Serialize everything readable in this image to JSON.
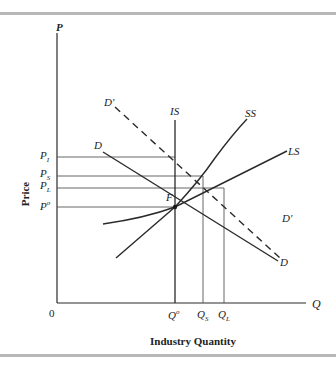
{
  "diagram": {
    "type": "supply-demand",
    "axes": {
      "y_symbol": "P",
      "x_symbol": "Q",
      "origin": "0",
      "y_title": "Price",
      "x_title": "Industry Quantity"
    },
    "price_levels": [
      {
        "id": "P_I",
        "base": "P",
        "sub": "I"
      },
      {
        "id": "P_S",
        "base": "P",
        "sub": "S"
      },
      {
        "id": "P_L",
        "base": "P",
        "sub": "L"
      },
      {
        "id": "P_o",
        "base": "P",
        "sup": "o"
      }
    ],
    "quantity_levels": [
      {
        "id": "Q_o",
        "base": "Q",
        "sup": "o"
      },
      {
        "id": "Q_S",
        "base": "Q",
        "sub": "S"
      },
      {
        "id": "Q_L",
        "base": "Q",
        "sub": "L"
      }
    ],
    "curves": [
      {
        "id": "D",
        "label": "D",
        "style": "solid",
        "kind": "demand"
      },
      {
        "id": "D_prime",
        "label": "D′",
        "style": "dashed",
        "kind": "shifted demand"
      },
      {
        "id": "IS",
        "label": "IS",
        "style": "solid",
        "kind": "immediate supply (vertical)"
      },
      {
        "id": "SS",
        "label": "SS",
        "style": "solid",
        "kind": "short-run supply"
      },
      {
        "id": "LS",
        "label": "LS",
        "style": "solid",
        "kind": "long-run supply"
      }
    ],
    "points": [
      {
        "id": "F",
        "label": "F",
        "note": "initial equilibrium at (Q°, P°)"
      }
    ],
    "colors": {
      "line": "#2a2a2a",
      "guide": "#555555",
      "rule": "#b8b8b8"
    }
  }
}
